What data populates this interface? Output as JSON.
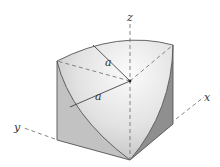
{
  "diagram": {
    "axes": {
      "x_label": "x",
      "y_label": "y",
      "z_label": "z"
    },
    "radius_labels": [
      "a",
      "a"
    ],
    "colors": {
      "face_left": "#c9c9c9",
      "face_right": "#dcdcdc",
      "sphere": "#e9e9e9",
      "sphere_highlight": "#f7f7f7",
      "cut_right": "#9a9a9a",
      "edge": "#555555",
      "axis": "#777777"
    }
  }
}
